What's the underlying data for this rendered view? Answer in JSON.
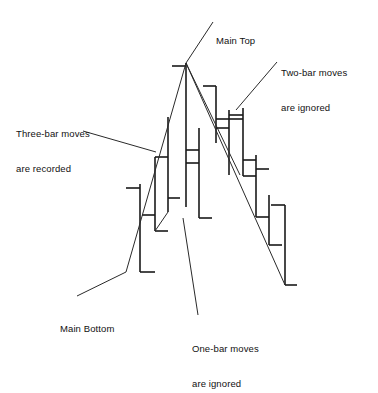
{
  "figure": {
    "background_color": "#ffffff",
    "line_color": "#1a1a1a",
    "trend_color": "#2a2a2a",
    "width": 378,
    "height": 355
  },
  "annotations": [
    {
      "id": "main-top",
      "lines": [
        "Main Top"
      ],
      "text": "Main Top",
      "x": 216,
      "y": 12,
      "leader": {
        "x1": 213,
        "y1": 22,
        "x2": 186,
        "y2": 63
      }
    },
    {
      "id": "two-bar",
      "lines": [
        "Two-bar moves",
        "are ignored"
      ],
      "text": "Two-bar moves are ignored",
      "x": 281,
      "y": 44,
      "leader": {
        "x1": 277,
        "y1": 62,
        "x2": 236,
        "y2": 110
      }
    },
    {
      "id": "three-bar",
      "lines": [
        "Three-bar moves",
        "are recorded"
      ],
      "text": "Three-bar moves are recorded",
      "x": 16,
      "y": 105,
      "leader": {
        "x1": 83,
        "y1": 131,
        "x2": 156,
        "y2": 152
      }
    },
    {
      "id": "main-bottom",
      "lines": [
        "Main Bottom"
      ],
      "text": "Main Bottom",
      "x": 60,
      "y": 300,
      "leader": {
        "x1": 77,
        "y1": 296,
        "x2": 126,
        "y2": 272
      }
    },
    {
      "id": "one-bar",
      "lines": [
        "One-bar moves",
        "are ignored"
      ],
      "text": "One-bar moves are ignored",
      "x": 192,
      "y": 320,
      "leader": {
        "x1": 198,
        "y1": 315,
        "x2": 183,
        "y2": 218
      }
    }
  ],
  "chart_data": {
    "type": "ohlc-bar-diagram",
    "xlabel": "",
    "ylabel": "",
    "grid": false,
    "legend": "none",
    "note": "Vertical bars with left (open) and right (close) ticks; y in screen pixels, smaller y = higher price",
    "bars": [
      {
        "index": 1,
        "x": 140,
        "y_high": 184,
        "y_low": 272,
        "open_tick_x": 126,
        "open_tick_y": 188,
        "close_tick_x": 155,
        "close_tick_y": 272
      },
      {
        "index": 2,
        "x": 155,
        "y_high": 157,
        "y_low": 231,
        "open_tick_x": 142,
        "open_tick_y": 215,
        "close_tick_x": 168,
        "close_tick_y": 231
      },
      {
        "index": 3,
        "x": 168,
        "y_high": 117,
        "y_low": 212,
        "open_tick_x": 155,
        "open_tick_y": 157,
        "close_tick_x": 180,
        "close_tick_y": 198
      },
      {
        "index": 4,
        "x": 186,
        "y_high": 63,
        "y_low": 207,
        "open_tick_x": 172,
        "open_tick_y": 66,
        "close_tick_x": 199,
        "close_tick_y": 163
      },
      {
        "index": 5,
        "x": 199,
        "y_high": 128,
        "y_low": 218,
        "open_tick_x": 186,
        "open_tick_y": 150,
        "close_tick_x": 212,
        "close_tick_y": 218
      },
      {
        "index": 6,
        "x": 216,
        "y_high": 86,
        "y_low": 143,
        "open_tick_x": 203,
        "open_tick_y": 86,
        "close_tick_x": 229,
        "close_tick_y": 128
      },
      {
        "index": 7,
        "x": 229,
        "y_high": 110,
        "y_low": 175,
        "open_tick_x": 216,
        "open_tick_y": 119,
        "close_tick_x": 243,
        "close_tick_y": 119
      },
      {
        "index": 8,
        "x": 243,
        "y_high": 108,
        "y_low": 176,
        "open_tick_x": 229,
        "open_tick_y": 115,
        "close_tick_x": 256,
        "close_tick_y": 176
      },
      {
        "index": 9,
        "x": 256,
        "y_high": 155,
        "y_low": 217,
        "open_tick_x": 243,
        "open_tick_y": 160,
        "close_tick_x": 269,
        "close_tick_y": 169
      },
      {
        "index": 10,
        "x": 269,
        "y_high": 195,
        "y_low": 245,
        "open_tick_x": 256,
        "open_tick_y": 217,
        "close_tick_x": 282,
        "close_tick_y": 245
      },
      {
        "index": 11,
        "x": 285,
        "y_high": 205,
        "y_low": 285,
        "open_tick_x": 271,
        "open_tick_y": 205,
        "close_tick_x": 297,
        "close_tick_y": 285
      }
    ],
    "trend_segments": [
      {
        "name": "main-up-leg",
        "x1": 126,
        "y1": 272,
        "x2": 186,
        "y2": 63
      },
      {
        "name": "minor-pullback",
        "x1": 155,
        "y1": 231,
        "x2": 168,
        "y2": 212
      },
      {
        "name": "main-down-leg",
        "x1": 186,
        "y1": 63,
        "x2": 285,
        "y2": 285
      },
      {
        "name": "secondary-down-leg",
        "x1": 186,
        "y1": 63,
        "x2": 240,
        "y2": 175
      }
    ],
    "key_points": [
      {
        "label": "Main Top",
        "x": 186,
        "y": 63
      },
      {
        "label": "Main Bottom",
        "x": 126,
        "y": 272
      }
    ]
  }
}
